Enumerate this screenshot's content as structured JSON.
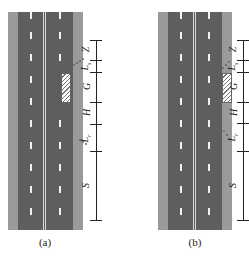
{
  "figure": {
    "panels": [
      {
        "id": "a",
        "caption": "(a)",
        "work_zone_position": "inner lane (right lane, adjacent to shoulder)",
        "labels": [
          {
            "key": "Z",
            "text": "Z",
            "sub": ""
          },
          {
            "key": "Ls",
            "text": "L",
            "sub": "s"
          },
          {
            "key": "G",
            "text": "G",
            "sub": ""
          },
          {
            "key": "H",
            "text": "H",
            "sub": ""
          },
          {
            "key": "Lr",
            "text": "L",
            "sub": "r"
          },
          {
            "key": "S",
            "text": "S",
            "sub": ""
          }
        ]
      },
      {
        "id": "b",
        "caption": "(b)",
        "work_zone_position": "shoulder",
        "labels": [
          {
            "key": "Z",
            "text": "Z",
            "sub": ""
          },
          {
            "key": "Ls",
            "text": "L",
            "sub": "s"
          },
          {
            "key": "G",
            "text": "G",
            "sub": ""
          },
          {
            "key": "H",
            "text": "H",
            "sub": ""
          },
          {
            "key": "Lr",
            "text": "L",
            "sub": "r"
          },
          {
            "key": "S",
            "text": "S",
            "sub": ""
          }
        ]
      }
    ],
    "colors": {
      "shoulder": "#9a9a9a",
      "lane": "#5e5e5e",
      "marking": "#f2f2f2",
      "dimension": "#222222"
    }
  }
}
